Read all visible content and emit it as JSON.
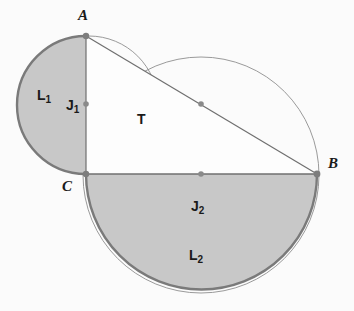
{
  "figure": {
    "background_color": "#fbfbfb",
    "fill_color": "#c8c8c8",
    "thick_stroke_color": "#7a7a7a",
    "thin_stroke_color": "#8c8c8c",
    "point_color": "#8a8a8a",
    "label_color": "#1a1a1a"
  },
  "vertices": [
    {
      "id": "A",
      "label": "A",
      "x": 86,
      "y": 36,
      "label_x": 78,
      "label_y": 8
    },
    {
      "id": "B",
      "label": "B",
      "x": 317,
      "y": 174,
      "label_x": 328,
      "label_y": 156
    },
    {
      "id": "C",
      "label": "C",
      "x": 86,
      "y": 174,
      "label_x": 62,
      "label_y": 179
    }
  ],
  "midpoints": [
    {
      "id": "mid-AB",
      "x": 201,
      "y": 104
    },
    {
      "id": "mid-CB",
      "x": 201,
      "y": 174
    },
    {
      "id": "mid-AC",
      "x": 86,
      "y": 104
    }
  ],
  "regions": [
    {
      "id": "T",
      "label": "T",
      "sub": "",
      "label_x": 137,
      "label_y": 112,
      "shaded": false
    },
    {
      "id": "J1",
      "label": "J",
      "sub": "1",
      "label_x": 66,
      "label_y": 98,
      "shaded": true
    },
    {
      "id": "J2",
      "label": "J",
      "sub": "2",
      "label_x": 191,
      "label_y": 199,
      "shaded": true
    },
    {
      "id": "L1",
      "label": "L",
      "sub": "1",
      "label_x": 37,
      "label_y": 88,
      "shaded": false
    },
    {
      "id": "L2",
      "label": "L",
      "sub": "2",
      "label_x": 189,
      "label_y": 248,
      "shaded": false
    }
  ],
  "segments": [
    {
      "id": "AB",
      "from": "A",
      "to": "B"
    },
    {
      "id": "AC",
      "from": "A",
      "to": "C"
    },
    {
      "id": "CB",
      "from": "C",
      "to": "B"
    }
  ],
  "arcs": {
    "lune_AC": {
      "description": "semicircle on diameter AC bulging left",
      "radius": 69
    },
    "lune_CB": {
      "description": "semicircle on diameter CB bulging down",
      "radius": 115.5
    },
    "circle_L1": {
      "description": "circle through A and C, center left of AC",
      "cx": 89,
      "cy": 105,
      "r": 69
    },
    "circle_L2": {
      "description": "circle through C and B, center below CB",
      "cx": 201,
      "cy": 175,
      "r": 118
    }
  }
}
